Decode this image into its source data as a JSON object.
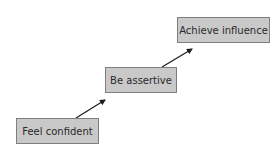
{
  "diagram": {
    "type": "staircase-flow",
    "steps": [
      {
        "label": "Feel confident"
      },
      {
        "label": "Be assertive"
      },
      {
        "label": "Achieve influence"
      }
    ],
    "arrows": [
      {
        "from": "Feel confident",
        "to": "Be assertive"
      },
      {
        "from": "Be assertive",
        "to": "Achieve influence"
      }
    ],
    "colors": {
      "box_fill": "#c9c9c9",
      "box_border": "#7f7f7f",
      "text": "#2a2a2a",
      "arrow": "#1a1a1a"
    }
  }
}
